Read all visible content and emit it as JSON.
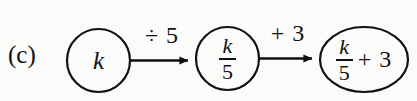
{
  "figure": {
    "part_label": "(c)",
    "background_color": "#fbfbf9",
    "ink_color": "#111111"
  },
  "nodes": [
    {
      "id": "node-1",
      "shape": "circle",
      "kind": "input",
      "text": "k",
      "numerator": "k",
      "denominator": "",
      "addend": ""
    },
    {
      "id": "node-2",
      "shape": "circle",
      "kind": "intermediate",
      "text": "k/5",
      "numerator": "k",
      "denominator": "5",
      "addend": ""
    },
    {
      "id": "node-3",
      "shape": "ellipse",
      "kind": "output",
      "text": "k/5 + 3",
      "numerator": "k",
      "denominator": "5",
      "addend": "+ 3"
    }
  ],
  "arrows": [
    {
      "id": "arrow-1",
      "from": "node-1",
      "to": "node-2",
      "operation_label": "÷ 5"
    },
    {
      "id": "arrow-2",
      "from": "node-2",
      "to": "node-3",
      "operation_label": "+ 3"
    }
  ]
}
